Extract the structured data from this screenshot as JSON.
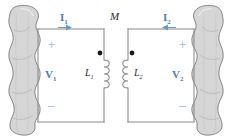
{
  "figure": {
    "type": "circuit-diagram",
    "background": "#ffffff",
    "accent_blue": "#4a7fb5",
    "polarity_blue": "#9cc3e0",
    "wire_color": "#8a8a8a",
    "blob_fill": "#d4d4d4",
    "blob_stroke": "#7a7a7a",
    "dot_color": "#1a1a1a"
  },
  "labels": {
    "current_left": "I",
    "current_left_sub": "1",
    "current_right": "I",
    "current_right_sub": "2",
    "mutual": "M",
    "voltage_left": "V",
    "voltage_left_sub": "1",
    "voltage_right": "V",
    "voltage_right_sub": "2",
    "inductor_left": "L",
    "inductor_left_sub": "1",
    "inductor_right": "L",
    "inductor_right_sub": "2",
    "plus_left": "+",
    "minus_left": "–",
    "plus_right": "+",
    "minus_right": "–"
  },
  "elements": {
    "left_network": "network-blob-left",
    "right_network": "network-blob-right",
    "left_dot": "polarity-dot-left",
    "right_dot": "polarity-dot-right",
    "left_arrow": "current-arrow-left",
    "right_arrow": "current-arrow-right"
  }
}
